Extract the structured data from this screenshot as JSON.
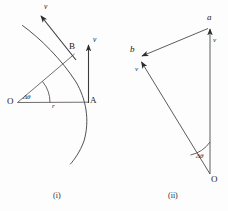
{
  "figure": {
    "background_color": "#fdfdfd",
    "ink_color": "#3a3a3a",
    "text_color": "#1a1a1a",
    "panels": [
      {
        "id": "panel-i",
        "caption": "(i)",
        "description": "circular-arc-with-tangential-velocity-vectors",
        "labels": {
          "center": "O",
          "point_a": "A",
          "point_b": "B",
          "radius": "r",
          "angle": "Δθ",
          "velocity_at_a": "v",
          "velocity_at_b": "v"
        }
      },
      {
        "id": "panel-ii",
        "caption": "(ii)",
        "description": "velocity-vector-triangle",
        "labels": {
          "origin": "O",
          "vertex_a": "a",
          "vertex_b": "b",
          "angle": "Δθ",
          "velocity_right": "v",
          "velocity_left": "v"
        }
      }
    ]
  }
}
